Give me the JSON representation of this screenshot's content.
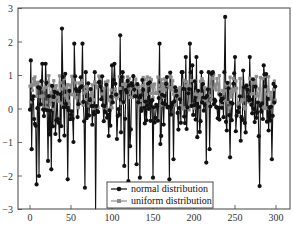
{
  "chart_data": {
    "type": "line",
    "title": "",
    "xlabel": "",
    "ylabel": "",
    "xlim": [
      -10,
      310
    ],
    "ylim": [
      -3,
      3
    ],
    "xticks": [
      0,
      50,
      100,
      150,
      200,
      250,
      300
    ],
    "yticks": [
      -3,
      -2,
      -1,
      0,
      1,
      2,
      3
    ],
    "grid": false,
    "legend_position": "lower center",
    "n_points": 300,
    "series": [
      {
        "name": "normal distribution",
        "color": "#111111",
        "marker": "circle",
        "notable_points": [
          {
            "x": 1,
            "y": 1.45
          },
          {
            "x": 2,
            "y": -1.2
          },
          {
            "x": 5,
            "y": -0.3
          },
          {
            "x": 8,
            "y": -2.25
          },
          {
            "x": 11,
            "y": -2.0
          },
          {
            "x": 15,
            "y": 1.35
          },
          {
            "x": 19,
            "y": 1.35
          },
          {
            "x": 22,
            "y": -1.55
          },
          {
            "x": 26,
            "y": -1.8
          },
          {
            "x": 39,
            "y": 2.4
          },
          {
            "x": 46,
            "y": -2.1
          },
          {
            "x": 54,
            "y": 1.95
          },
          {
            "x": 64,
            "y": 1.95
          },
          {
            "x": 67,
            "y": -2.35
          },
          {
            "x": 80,
            "y": -3.0
          },
          {
            "x": 100,
            "y": 1.3
          },
          {
            "x": 103,
            "y": 1.35
          },
          {
            "x": 110,
            "y": 2.2
          },
          {
            "x": 115,
            "y": -1.7
          },
          {
            "x": 120,
            "y": -2.15
          },
          {
            "x": 130,
            "y": -1.65
          },
          {
            "x": 134,
            "y": -2.05
          },
          {
            "x": 150,
            "y": -2.05
          },
          {
            "x": 158,
            "y": 1.95
          },
          {
            "x": 170,
            "y": -2.1
          },
          {
            "x": 190,
            "y": 1.55
          },
          {
            "x": 195,
            "y": 1.95
          },
          {
            "x": 198,
            "y": 1.3
          },
          {
            "x": 203,
            "y": 1.55
          },
          {
            "x": 215,
            "y": -1.6
          },
          {
            "x": 219,
            "y": -1.2
          },
          {
            "x": 238,
            "y": 2.75
          },
          {
            "x": 250,
            "y": 1.55
          },
          {
            "x": 260,
            "y": 1.15
          },
          {
            "x": 268,
            "y": 1.55
          },
          {
            "x": 280,
            "y": -2.3
          },
          {
            "x": 285,
            "y": 1.3
          },
          {
            "x": 290,
            "y": 0.3
          },
          {
            "x": 295,
            "y": -1.5
          },
          {
            "x": 297,
            "y": 0.75
          }
        ]
      },
      {
        "name": "uniform distribution",
        "color": "#8c8c8c",
        "marker": "square",
        "range": [
          0,
          1
        ]
      }
    ]
  },
  "legend": {
    "items": [
      {
        "label": "normal distribution"
      },
      {
        "label": "uniform distribution"
      }
    ]
  }
}
